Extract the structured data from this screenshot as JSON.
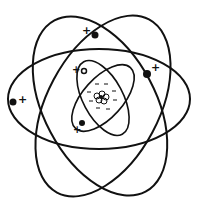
{
  "diagram": {
    "colors": {
      "ink": "#111111",
      "background": "#ffffff"
    },
    "nucleus": {
      "center": [
        101,
        98
      ],
      "protons": 6,
      "charges": [
        "-",
        "-",
        "-",
        "-",
        "-",
        "-"
      ]
    },
    "orbits": [
      {
        "id": "outer-horizontal",
        "cx": 103,
        "cy": 100,
        "rx": 91,
        "ry": 50,
        "rotate": 0
      },
      {
        "id": "outer-tilted-left",
        "cx": 100,
        "cy": 105,
        "rx": 95,
        "ry": 58,
        "rotate": 62
      },
      {
        "id": "outer-tilted-right",
        "cx": 103,
        "cy": 105,
        "rx": 98,
        "ry": 58,
        "rotate": 118
      },
      {
        "id": "inner-a",
        "cx": 103,
        "cy": 98,
        "rx": 40,
        "ry": 22,
        "rotate": 60
      },
      {
        "id": "inner-b",
        "cx": 103,
        "cy": 98,
        "rx": 40,
        "ry": 20,
        "rotate": 125
      }
    ],
    "electrons": [
      {
        "x": 95,
        "y": 35,
        "sign": "+",
        "sx": 86,
        "sy": 33
      },
      {
        "x": 147,
        "y": 74,
        "sign": "+",
        "sx": 154,
        "sy": 70
      },
      {
        "x": 13,
        "y": 102,
        "sign": "+",
        "sx": 21,
        "sy": 102
      },
      {
        "x": 84,
        "y": 71,
        "sign": "+",
        "sx": 76,
        "sy": 72
      },
      {
        "x": 82,
        "y": 123,
        "sign": "+",
        "sx": 76,
        "sy": 132
      }
    ]
  }
}
